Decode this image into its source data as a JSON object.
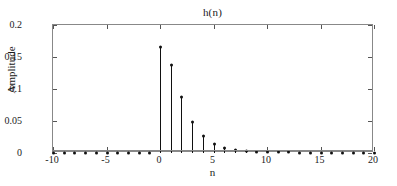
{
  "chart_data": {
    "type": "scatter",
    "plot_style": "stem",
    "title": "h(n)",
    "xlabel": "n",
    "ylabel": "Amplitude",
    "xlim": [
      -10,
      20
    ],
    "ylim": [
      0,
      0.2
    ],
    "grid": false,
    "legend": null,
    "xticks": [
      -10,
      -5,
      0,
      5,
      10,
      15,
      20
    ],
    "xtick_labels": [
      "-10",
      "-5",
      "0",
      "5",
      "10",
      "15",
      "20"
    ],
    "yticks": [
      0,
      0.05,
      0.1,
      0.15,
      0.2
    ],
    "ytick_labels": [
      "0",
      "0.05",
      "0.1",
      "0.15",
      "0.2"
    ],
    "x": [
      -10,
      -9,
      -8,
      -7,
      -6,
      -5,
      -4,
      -3,
      -2,
      -1,
      0,
      1,
      2,
      3,
      4,
      5,
      6,
      7,
      8,
      9,
      10,
      11,
      12,
      13,
      14,
      15,
      16,
      17,
      18,
      19,
      20
    ],
    "values": [
      0,
      0,
      0,
      0,
      0,
      0,
      0,
      0,
      0,
      0,
      0.165,
      0.138,
      0.088,
      0.048,
      0.027,
      0.014,
      0.008,
      0.005,
      0.003,
      0.002,
      0.001,
      0.001,
      0.001,
      0,
      0,
      0,
      0,
      0,
      0,
      0,
      0
    ],
    "marker": "filled-circle",
    "line_color": "#111111",
    "marker_color": "#111111",
    "axis_color": "#888888"
  }
}
